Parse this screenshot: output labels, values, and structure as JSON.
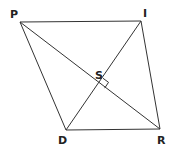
{
  "diagram": {
    "type": "geometry-quadrilateral",
    "colors": {
      "line": "#333333",
      "label": "#222222",
      "background": "#ffffff"
    },
    "points": {
      "P": {
        "label": "P",
        "x": 20,
        "y": 22,
        "lx": 10,
        "ly": 18
      },
      "I": {
        "label": "I",
        "x": 141,
        "y": 21,
        "lx": 143,
        "ly": 17
      },
      "D": {
        "label": "D",
        "x": 66,
        "y": 130,
        "lx": 58,
        "ly": 144
      },
      "R": {
        "label": "R",
        "x": 160,
        "y": 129,
        "lx": 157,
        "ly": 144
      },
      "S": {
        "label": "S",
        "x": 99,
        "y": 84,
        "lx": 95,
        "ly": 79
      }
    },
    "edges": [
      [
        "P",
        "I"
      ],
      [
        "I",
        "R"
      ],
      [
        "R",
        "D"
      ],
      [
        "D",
        "P"
      ],
      [
        "P",
        "R"
      ],
      [
        "I",
        "D"
      ]
    ],
    "right_angle_at": "S"
  }
}
